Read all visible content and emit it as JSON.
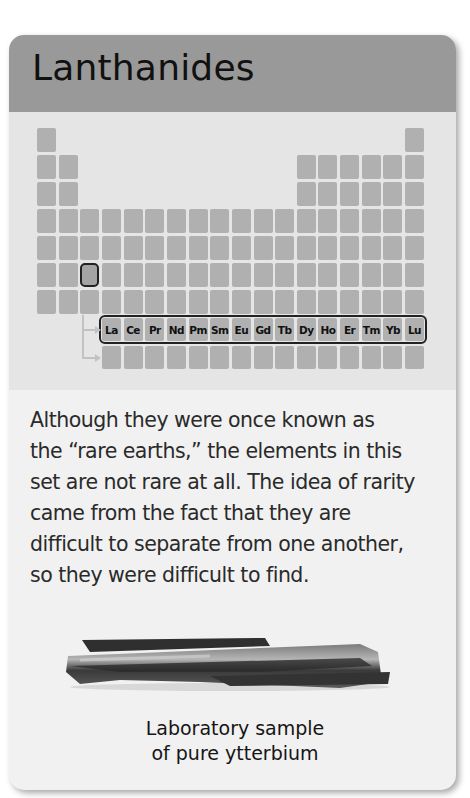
{
  "card": {
    "title": "Lanthanides",
    "colors": {
      "header": "#999999",
      "table_panel": "#e5e5e5",
      "card_body": "#f1f1f1",
      "cell": "#b0b0b0",
      "highlight_outline": "#222222"
    }
  },
  "periodic_table": {
    "highlighted_cell": {
      "row": 6,
      "column": 3
    },
    "lanthanide_row": [
      "La",
      "Ce",
      "Pr",
      "Nd",
      "Pm",
      "Sm",
      "Eu",
      "Gd",
      "Tb",
      "Dy",
      "Ho",
      "Er",
      "Tm",
      "Yb",
      "Lu"
    ]
  },
  "description_lines": [
    "Although they were once known as",
    "the “rare earths,” the elements in this",
    "set are not rare at all. The idea of rarity",
    "came from the fact that they are",
    "difficult to separate from one another,",
    "so they were difficult to find."
  ],
  "image": {
    "subject": "ytterbium-sample",
    "caption_lines": [
      "Laboratory sample",
      "of pure ytterbium"
    ]
  }
}
